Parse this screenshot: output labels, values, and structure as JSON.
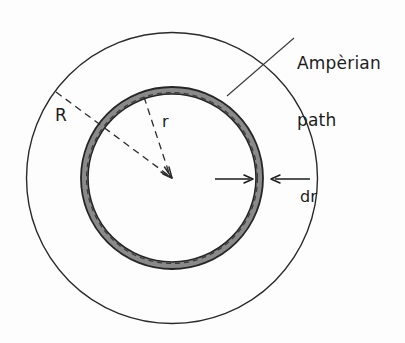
{
  "figure": {
    "background_color": "#fdfdfd",
    "line_color": "#1c1c1c",
    "shell_fill_color": "#8c8c8c",
    "shell_stroke_color": "#2b2b2b",
    "dashed_color": "#2b2b2b",
    "labels": {
      "ampere_line1": "Ampèrian",
      "ampere_line2": "path",
      "outer_radius": "R",
      "inner_radius": "r",
      "thickness": "dr"
    },
    "geometry": {
      "center_x": 172,
      "center_y": 178,
      "outer_circle_radius": 146,
      "shell_outer_radius": 91,
      "shell_thickness": 7,
      "radius_R_angle_deg": 217,
      "radius_r_angle_deg": 250
    }
  }
}
